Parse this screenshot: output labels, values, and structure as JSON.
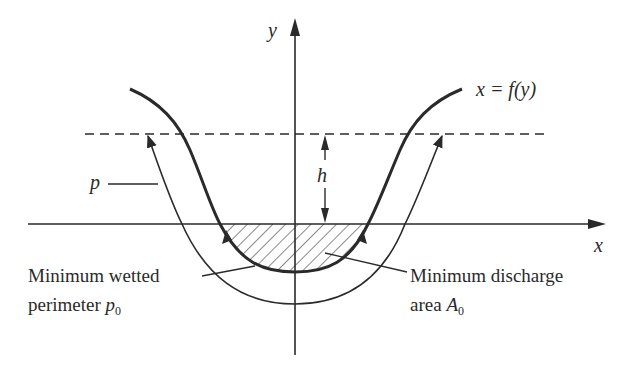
{
  "diagram": {
    "axes": {
      "x_label": "x",
      "y_label": "y"
    },
    "curve_label": "x = f(y)",
    "height_label": "h",
    "outer_curve_label": "p",
    "annotations": {
      "wetted_perimeter_line1": "Minimum wetted",
      "wetted_perimeter_line2": "perimeter ",
      "wetted_perimeter_symbol": "p",
      "wetted_perimeter_subscript": "0",
      "discharge_area_line1": "Minimum discharge",
      "discharge_area_line2": "area ",
      "discharge_area_symbol": "A",
      "discharge_area_subscript": "0"
    },
    "colors": {
      "stroke": "#2a2a2a",
      "background": "#ffffff"
    }
  }
}
